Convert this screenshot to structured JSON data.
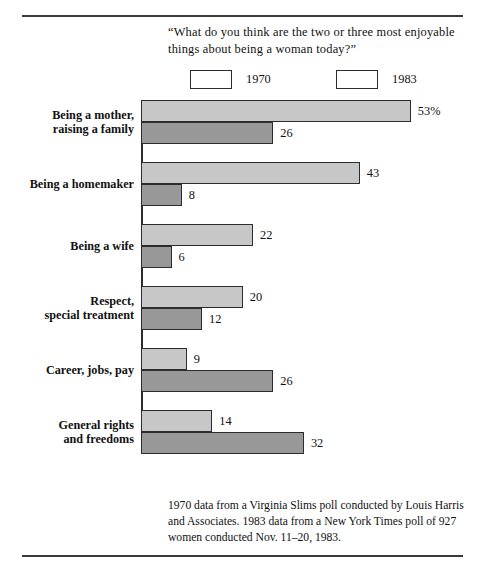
{
  "question": "“What do you think are the two or three most enjoyable things about being a woman today?”",
  "legend": {
    "items": [
      {
        "label": "1970",
        "color": "#c7c7c7"
      },
      {
        "label": "1983",
        "color": "#989898"
      }
    ]
  },
  "source_note": "1970 data from a Virginia Slims poll conducted by Louis Harris and Associates. 1983 data from a New York Times poll of 927 women conducted Nov. 11–20, 1983.",
  "chart_data": {
    "type": "bar",
    "orientation": "horizontal",
    "title": "“What do you think are the two or three most enjoyable things about being a woman today?”",
    "xlabel": "",
    "ylabel": "",
    "xlim": [
      0,
      53
    ],
    "grid": false,
    "legend_position": "top",
    "categories": [
      "Being a mother, raising a family",
      "Being a homemaker",
      "Being a wife",
      "Respect, special treatment",
      "Career, jobs, pay",
      "General rights and freedoms"
    ],
    "category_lines": [
      [
        "Being a mother,",
        "raising a family"
      ],
      [
        "Being a homemaker"
      ],
      [
        "Being a wife"
      ],
      [
        "Respect,",
        "special treatment"
      ],
      [
        "Career, jobs, pay"
      ],
      [
        "General rights",
        "and freedoms"
      ]
    ],
    "series": [
      {
        "name": "1970",
        "color": "#c7c7c7",
        "values": [
          53,
          43,
          22,
          20,
          9,
          14
        ],
        "labels": [
          "53%",
          "43",
          "22",
          "20",
          "9",
          "14"
        ]
      },
      {
        "name": "1983",
        "color": "#989898",
        "values": [
          26,
          8,
          6,
          12,
          26,
          32
        ],
        "labels": [
          "26",
          "8",
          "6",
          "12",
          "26",
          "32"
        ]
      }
    ]
  }
}
